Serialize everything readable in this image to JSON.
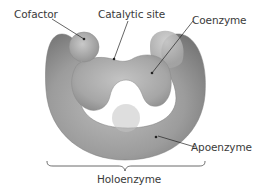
{
  "figure": {
    "labels": {
      "cofactor": "Cofactor",
      "catalytic_site": "Catalytic site",
      "coenzyme": "Coenzyme",
      "apoenzyme": "Apoenzyme",
      "holoenzyme": "Holoenzyme"
    },
    "colors": {
      "enzyme_body": "#9a9a9a",
      "enzyme_highlight": "#c8c8c8",
      "enzyme_shadow": "#6e6e6e",
      "label_text": "#3a3a3a",
      "leader_line": "#222222"
    }
  }
}
